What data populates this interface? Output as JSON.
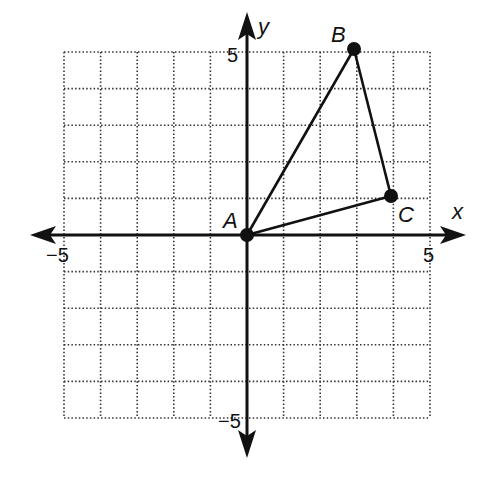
{
  "diagram": {
    "type": "coordinate-plane-triangle",
    "axes": {
      "x_label": "x",
      "y_label": "y",
      "x_range": [
        -5,
        5
      ],
      "y_range": [
        -5,
        5
      ],
      "tick_labels": {
        "x_neg": "−5",
        "x_pos": "5",
        "y_pos": "5",
        "y_neg": "−5"
      }
    },
    "grid": {
      "step": 1,
      "style": "dotted"
    },
    "points": [
      {
        "name": "A",
        "x": 0,
        "y": 0
      },
      {
        "name": "B",
        "x": 3,
        "y": 5
      },
      {
        "name": "C",
        "x": 4,
        "y": 1
      }
    ],
    "segments": [
      [
        "A",
        "B"
      ],
      [
        "B",
        "C"
      ],
      [
        "C",
        "A"
      ]
    ],
    "colors": {
      "ink": "#111111",
      "grid": "#333333",
      "background": "#ffffff"
    }
  }
}
